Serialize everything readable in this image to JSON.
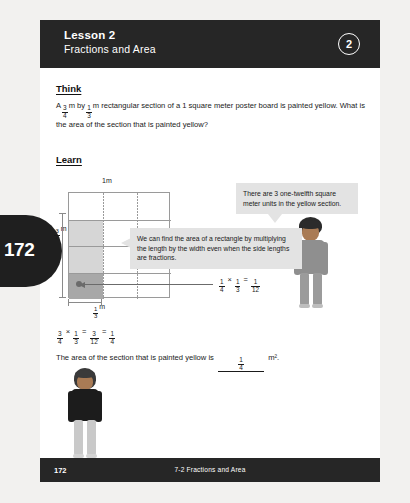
{
  "page": {
    "tab_number": "172",
    "background_color": "#f2f1ef",
    "header_color": "#262626"
  },
  "header": {
    "lesson_label": "Lesson 2",
    "lesson_title": "Fractions and Area",
    "badge_number": "2"
  },
  "think": {
    "heading": "Think",
    "text_part1": "A",
    "frac1_num": "3",
    "frac1_den": "4",
    "text_part2": "m by",
    "frac2_num": "1",
    "frac2_den": "3",
    "text_part3": "m rectangular section of a 1 square meter poster board is painted yellow. What is the area of the section that is painted yellow?"
  },
  "learn": {
    "heading": "Learn"
  },
  "diagram": {
    "label_top": "1m",
    "label_right": "1m",
    "label_left_num": "3",
    "label_left_den": "4",
    "label_left_unit": "m",
    "label_bottom_num": "1",
    "label_bottom_den": "3",
    "label_bottom_unit": "m",
    "rows": 4,
    "columns": 3,
    "shaded_cells": [
      {
        "row": 2,
        "col": 1,
        "tone": "light"
      },
      {
        "row": 3,
        "col": 1,
        "tone": "light"
      },
      {
        "row": 4,
        "col": 1,
        "tone": "dark"
      }
    ],
    "unit_equation": {
      "a_num": "1",
      "a_den": "4",
      "times": "×",
      "b_num": "1",
      "b_den": "3",
      "equals": "=",
      "r_num": "1",
      "r_den": "12"
    }
  },
  "callout_top": {
    "text": "There are 3 one-twelfth square meter units in the yellow section."
  },
  "callout_bottom": {
    "text": "We can find the area of a rectangle by multiplying the length by the width even when the side lengths are fractions."
  },
  "main_equation": {
    "a_num": "3",
    "a_den": "4",
    "times": "×",
    "b_num": "1",
    "b_den": "3",
    "eq1": "=",
    "c_num": "3",
    "c_den": "12",
    "eq2": "=",
    "d_num": "1",
    "d_den": "4"
  },
  "answer": {
    "prefix": "The area of the section that is painted yellow is",
    "blank_num": "1",
    "blank_den": "4",
    "suffix": "m²."
  },
  "footer": {
    "page_number": "172",
    "title": "7-2  Fractions and Area"
  }
}
